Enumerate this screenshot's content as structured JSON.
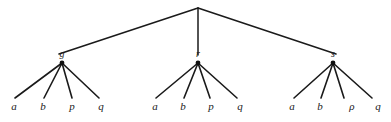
{
  "figure": {
    "type": "tree-diagram",
    "background_color": "#ffffff",
    "line_color": "#1a1a1a",
    "text_color": "#1a1a1a",
    "root": {
      "label": "",
      "x": 198,
      "y": 8
    },
    "internal_nodes": [
      {
        "id": "g",
        "label": "g",
        "x": 62,
        "y": 62,
        "label_x": 62,
        "label_y": 57
      },
      {
        "id": "r",
        "label": "r",
        "x": 198,
        "y": 62,
        "label_x": 198,
        "label_y": 57
      },
      {
        "id": "s",
        "label": "s",
        "x": 333,
        "y": 62,
        "label_x": 333,
        "label_y": 57
      }
    ],
    "top_edges": [
      {
        "from": "root",
        "to": "g",
        "x1": 198,
        "y1": 8,
        "x2": 59,
        "y2": 54
      },
      {
        "from": "root",
        "to": "r",
        "x1": 198,
        "y1": 8,
        "x2": 198,
        "y2": 55
      },
      {
        "from": "root",
        "to": "s",
        "x1": 198,
        "y1": 8,
        "x2": 336,
        "y2": 54
      }
    ],
    "subtrees": [
      {
        "parent": "g",
        "parent_x": 62,
        "parent_y": 63,
        "leaves": [
          {
            "label": "a",
            "x": 14,
            "y": 110,
            "edge_x": 15,
            "edge_y": 98
          },
          {
            "label": "b",
            "x": 43,
            "y": 110,
            "edge_x": 44,
            "edge_y": 98
          },
          {
            "label": "p",
            "x": 72,
            "y": 110,
            "edge_x": 72,
            "edge_y": 98
          },
          {
            "label": "q",
            "x": 101,
            "y": 110,
            "edge_x": 99,
            "edge_y": 98
          }
        ]
      },
      {
        "parent": "r",
        "parent_x": 198,
        "parent_y": 63,
        "leaves": [
          {
            "label": "a",
            "x": 155,
            "y": 110,
            "edge_x": 156,
            "edge_y": 98
          },
          {
            "label": "b",
            "x": 183,
            "y": 110,
            "edge_x": 184,
            "edge_y": 98
          },
          {
            "label": "p",
            "x": 211,
            "y": 110,
            "edge_x": 210,
            "edge_y": 98
          },
          {
            "label": "q",
            "x": 240,
            "y": 110,
            "edge_x": 237,
            "edge_y": 98
          }
        ]
      },
      {
        "parent": "s",
        "parent_x": 333,
        "parent_y": 63,
        "leaves": [
          {
            "label": "a",
            "x": 292,
            "y": 110,
            "edge_x": 294,
            "edge_y": 98
          },
          {
            "label": "b",
            "x": 320,
            "y": 110,
            "edge_x": 321,
            "edge_y": 98
          },
          {
            "label": "ρ",
            "x": 352,
            "y": 110,
            "edge_x": 344,
            "edge_y": 98
          },
          {
            "label": "q",
            "x": 378,
            "y": 110,
            "edge_x": 372,
            "edge_y": 98
          }
        ]
      }
    ]
  }
}
